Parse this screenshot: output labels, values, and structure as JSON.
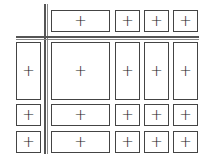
{
  "diagram": {
    "type": "grid-layout",
    "cell_glyph": "+",
    "line_color": "#444444",
    "columns": [
      {
        "id": "c0",
        "x": 16,
        "w": 25
      },
      {
        "id": "c1",
        "x": 51,
        "w": 59
      },
      {
        "id": "c2",
        "x": 115,
        "w": 25
      },
      {
        "id": "c3",
        "x": 144,
        "w": 25
      },
      {
        "id": "c4",
        "x": 173,
        "w": 25
      }
    ],
    "rows": [
      {
        "id": "r0",
        "y": 10,
        "h": 22
      },
      {
        "id": "r1",
        "y": 42,
        "h": 58
      },
      {
        "id": "r2",
        "y": 104,
        "h": 22
      },
      {
        "id": "r3",
        "y": 131,
        "h": 22
      }
    ],
    "cells": [
      {
        "r": 0,
        "c": 1,
        "label": "+"
      },
      {
        "r": 0,
        "c": 2,
        "label": "+"
      },
      {
        "r": 0,
        "c": 3,
        "label": "+"
      },
      {
        "r": 0,
        "c": 4,
        "label": "+"
      },
      {
        "r": 1,
        "c": 0,
        "label": "+"
      },
      {
        "r": 1,
        "c": 1,
        "label": "+"
      },
      {
        "r": 1,
        "c": 2,
        "label": "+"
      },
      {
        "r": 1,
        "c": 3,
        "label": "+"
      },
      {
        "r": 1,
        "c": 4,
        "label": "+"
      },
      {
        "r": 2,
        "c": 0,
        "label": "+"
      },
      {
        "r": 2,
        "c": 1,
        "label": "+"
      },
      {
        "r": 2,
        "c": 2,
        "label": "+"
      },
      {
        "r": 2,
        "c": 3,
        "label": "+"
      },
      {
        "r": 2,
        "c": 4,
        "label": "+"
      },
      {
        "r": 3,
        "c": 0,
        "label": "+"
      },
      {
        "r": 3,
        "c": 1,
        "label": "+"
      },
      {
        "r": 3,
        "c": 2,
        "label": "+"
      },
      {
        "r": 3,
        "c": 3,
        "label": "+"
      },
      {
        "r": 3,
        "c": 4,
        "label": "+"
      }
    ]
  }
}
